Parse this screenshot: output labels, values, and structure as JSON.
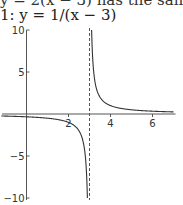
{
  "top_text": "y = 2(x − 3)   has the same sig",
  "caption": "1: y = 1/(x − 3)",
  "chart_data": {
    "type": "line",
    "title": "1: y = 1/(x − 3)",
    "function": "y = 1/(x - 3)",
    "xlabel": "",
    "ylabel": "",
    "xlim": [
      -1.2,
      7
    ],
    "ylim": [
      -10,
      10
    ],
    "x_ticks": [
      2,
      4,
      6
    ],
    "x_tick_labels": [
      "2",
      "4",
      "6"
    ],
    "y_ticks": [
      10,
      5,
      -5,
      -10
    ],
    "y_tick_labels": [
      "10",
      "5",
      "-5",
      "-10"
    ],
    "vertical_asymptote": {
      "x": 3,
      "style": "dashed"
    },
    "horizontal_asymptote": {
      "y": 0
    },
    "grid": false,
    "legend": null,
    "series": [
      {
        "name": "left branch",
        "x": [
          -1.2,
          -1,
          0,
          1,
          2,
          2.5,
          2.8,
          2.9
        ],
        "values": [
          -0.24,
          -0.25,
          -0.33,
          -0.5,
          -1,
          -2,
          -5,
          -10
        ]
      },
      {
        "name": "right branch",
        "x": [
          3.1,
          3.2,
          3.5,
          4,
          5,
          6,
          7
        ],
        "values": [
          10,
          5,
          2,
          1,
          0.5,
          0.33,
          0.25
        ]
      }
    ],
    "colors": {
      "curve": "#333333",
      "axes": "#555555",
      "asymptote": "#555555"
    }
  }
}
